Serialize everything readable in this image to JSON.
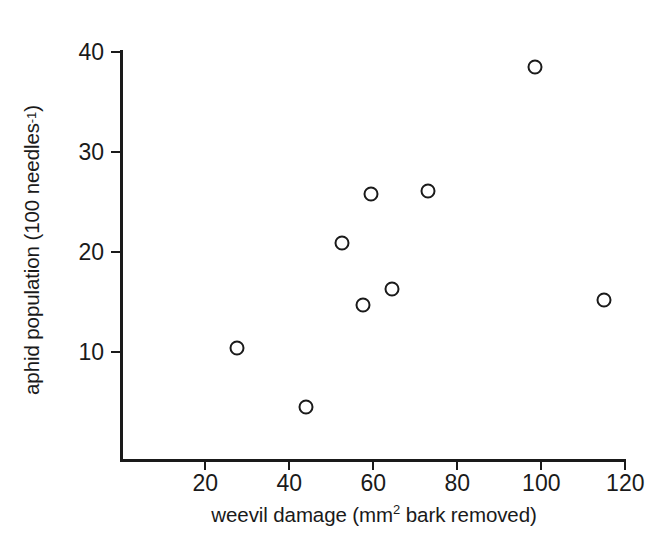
{
  "chart_data": {
    "type": "scatter",
    "title": "",
    "xlabel": "weevil damage (mm² bark removed)",
    "ylabel": "aphid population (100 needles⁻¹)",
    "xlabel_parts": {
      "main": "weevil damage (mm",
      "sup": "2",
      "tail": " bark removed)"
    },
    "ylabel_parts": {
      "main": "aphid population (100 needles",
      "sup": "-1",
      "tail": ")"
    },
    "xlim": [
      0,
      126
    ],
    "ylim": [
      0,
      41
    ],
    "xticks": [
      20,
      40,
      60,
      80,
      100,
      120
    ],
    "xtick_labels": [
      "20",
      "40",
      "60",
      "80",
      "100",
      "120"
    ],
    "yticks": [
      10,
      20,
      30,
      40
    ],
    "ytick_labels": [
      "10",
      "20",
      "30",
      "40"
    ],
    "grid": false,
    "legend": null,
    "marker": "open-circle",
    "marker_color": "#1a1a1a",
    "points": [
      {
        "x": 27.5,
        "y": 10.4
      },
      {
        "x": 44.0,
        "y": 4.5
      },
      {
        "x": 52.5,
        "y": 20.9
      },
      {
        "x": 57.5,
        "y": 14.7
      },
      {
        "x": 59.5,
        "y": 25.8
      },
      {
        "x": 64.5,
        "y": 16.3
      },
      {
        "x": 73.0,
        "y": 26.1
      },
      {
        "x": 98.5,
        "y": 38.5
      },
      {
        "x": 115.0,
        "y": 15.2
      }
    ]
  },
  "figure": {
    "background": "#ffffff",
    "axis_color": "#1a1a1a"
  }
}
